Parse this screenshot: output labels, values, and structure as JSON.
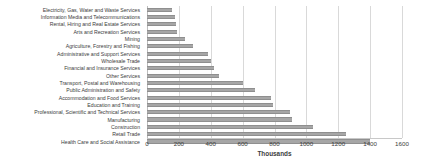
{
  "chart_data": {
    "type": "bar",
    "orientation": "horizontal",
    "title": "",
    "xlabel": "Thousands",
    "ylabel": "",
    "xlim": [
      0,
      1600
    ],
    "xticks": [
      0,
      200,
      400,
      600,
      800,
      1000,
      1200,
      1400,
      1600
    ],
    "grid": true,
    "legend": "none",
    "bar_color": "#a6a6a6",
    "categories": [
      "Electricity, Gas, Water and Waste Services",
      "Information Media and Telecommunications",
      "Rental, Hiring and Real Estate Services",
      "Arts and Recreation Services",
      "Mining",
      "Agriculture, Forestry and Fishing",
      "Administrative and Support Services",
      "Wholesale Trade",
      "Financial and Insurance Services",
      "Other Services",
      "Transport, Postal and Warehousing",
      "Public Administration and Safety",
      "Accommodation and Food Services",
      "Education and Training",
      "Professional, Scientific and Technical Services",
      "Manufacturing",
      "Construction",
      "Retail Trade",
      "Health Care and Social Assistance"
    ],
    "values": [
      155,
      175,
      185,
      190,
      240,
      290,
      380,
      400,
      420,
      450,
      600,
      680,
      780,
      790,
      900,
      910,
      1040,
      1250,
      1400
    ]
  }
}
